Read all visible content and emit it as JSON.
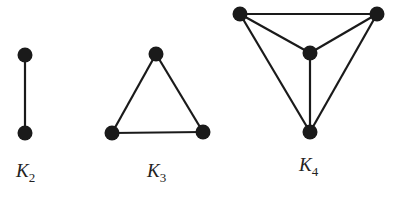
{
  "graphs": [
    {
      "name": "K2",
      "label": "K",
      "sub": "2",
      "label_pos": [
        16,
        160
      ],
      "nodes": [
        [
          25,
          55
        ],
        [
          25,
          133
        ]
      ],
      "edges": [
        [
          0,
          1
        ]
      ]
    },
    {
      "name": "K3",
      "label": "K",
      "sub": "3",
      "label_pos": [
        147,
        160
      ],
      "nodes": [
        [
          156,
          54
        ],
        [
          112,
          133
        ],
        [
          203,
          132
        ]
      ],
      "edges": [
        [
          0,
          1
        ],
        [
          0,
          2
        ],
        [
          1,
          2
        ]
      ]
    },
    {
      "name": "K4",
      "label": "K",
      "sub": "4",
      "label_pos": [
        299,
        154
      ],
      "nodes": [
        [
          240,
          14
        ],
        [
          377,
          14
        ],
        [
          310,
          53
        ],
        [
          310,
          132
        ]
      ],
      "edges": [
        [
          0,
          1
        ],
        [
          0,
          2
        ],
        [
          1,
          2
        ],
        [
          0,
          3
        ],
        [
          1,
          3
        ],
        [
          2,
          3
        ]
      ]
    }
  ],
  "colors": {
    "ink": "#1a1a1a",
    "background": "#ffffff"
  }
}
